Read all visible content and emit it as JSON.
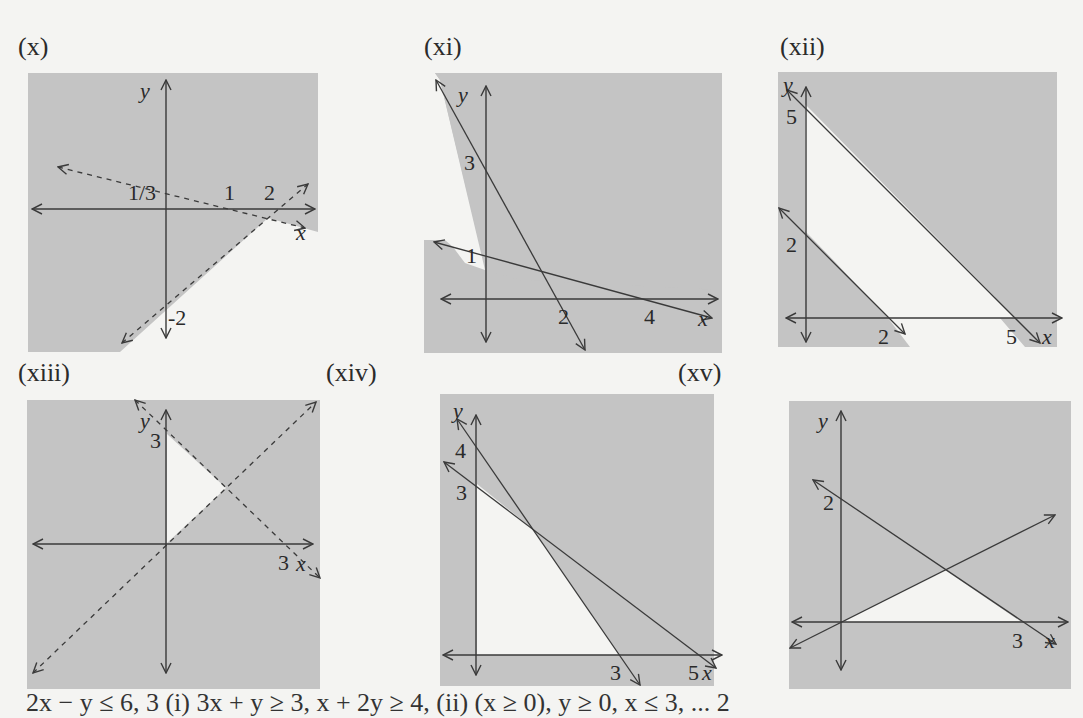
{
  "colors": {
    "page_background": "#f4f4f2",
    "shade": "#c4c4c4",
    "line": "#3a3a3a"
  },
  "panels": [
    {
      "id": "x",
      "label": "(x)",
      "axis_x": "x",
      "axis_y": "y",
      "ticks": [
        "1/3",
        "1",
        "2",
        "-2"
      ],
      "line_style": "dashed"
    },
    {
      "id": "xi",
      "label": "(xi)",
      "axis_x": "x",
      "axis_y": "y",
      "ticks": [
        "3",
        "1",
        "2",
        "4"
      ],
      "line_style": "solid"
    },
    {
      "id": "xii",
      "label": "(xii)",
      "axis_x": "x",
      "axis_y": "y",
      "ticks": [
        "5",
        "2",
        "2",
        "5"
      ],
      "line_style": "solid"
    },
    {
      "id": "xiii",
      "label": "(xiii)",
      "axis_x": "x",
      "axis_y": "y",
      "ticks": [
        "3",
        "3"
      ],
      "line_style": "dashed"
    },
    {
      "id": "xiv",
      "label": "(xiv)",
      "axis_x": "x",
      "axis_y": "y",
      "ticks": [
        "4",
        "3",
        "3",
        "5"
      ],
      "line_style": "solid"
    },
    {
      "id": "xv",
      "label": "(xv)",
      "axis_x": "x",
      "axis_y": "y",
      "ticks": [
        "2",
        "3"
      ],
      "line_style": "solid"
    }
  ],
  "bottom_text": "2x − y ≤ 6, 3 (i) 3x + y ≥ 3, x + 2y ≥ 4, (ii) (x ≥ 0), y ≥ 0, x ≤ 3, ... 2"
}
